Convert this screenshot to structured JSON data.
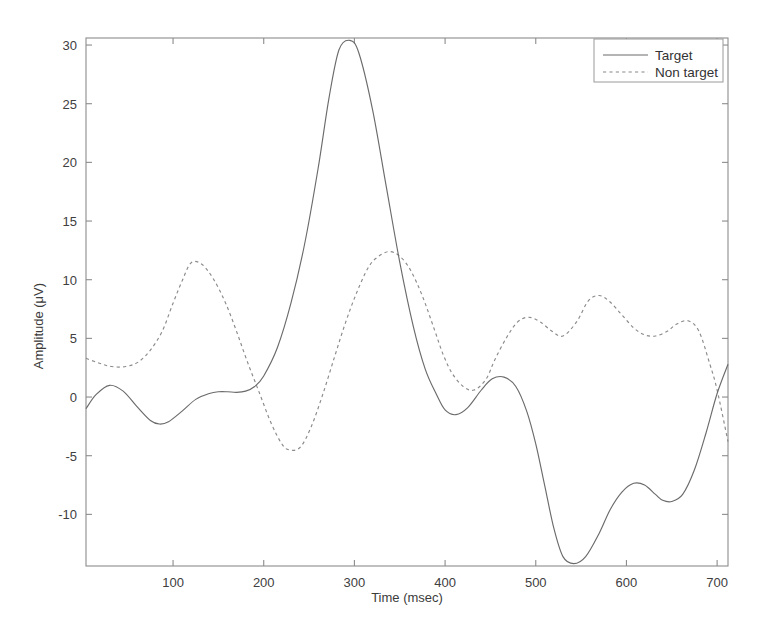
{
  "chart_data": {
    "type": "line",
    "title": "",
    "xlabel": "Time (msec)",
    "ylabel": "Amplitude (μV)",
    "xlim": [
      4,
      712
    ],
    "ylim": [
      -14.4,
      30.6
    ],
    "xticks": [
      100,
      200,
      300,
      400,
      500,
      600,
      700
    ],
    "yticks": [
      -10,
      -5,
      0,
      5,
      10,
      15,
      20,
      25,
      30
    ],
    "xtick_labels": [
      "100",
      "200",
      "300",
      "400",
      "500",
      "600",
      "700"
    ],
    "ytick_labels": [
      "-10",
      "-5",
      "0",
      "5",
      "10",
      "15",
      "20",
      "25",
      "30"
    ],
    "grid": false,
    "legend_position": "top-right",
    "legend_entries": [
      "Target",
      "Non target"
    ],
    "series": [
      {
        "name": "Target",
        "style": "solid",
        "color": "#6b6b6b",
        "x": [
          4,
          15,
          30,
          45,
          60,
          75,
          85,
          95,
          110,
          125,
          140,
          150,
          160,
          170,
          180,
          190,
          200,
          215,
          230,
          245,
          260,
          272,
          283,
          295,
          305,
          320,
          335,
          350,
          365,
          378,
          390,
          400,
          412,
          425,
          440,
          452,
          465,
          478,
          490,
          500,
          510,
          520,
          530,
          542,
          555,
          570,
          582,
          595,
          608,
          620,
          632,
          640,
          650,
          662,
          675,
          688,
          700,
          712
        ],
        "y": [
          -1.0,
          0.2,
          1.0,
          0.5,
          -0.8,
          -2.0,
          -2.3,
          -2.1,
          -1.2,
          -0.2,
          0.3,
          0.45,
          0.45,
          0.4,
          0.5,
          0.9,
          1.8,
          4.2,
          8.0,
          13.0,
          19.5,
          25.5,
          29.6,
          30.4,
          29.3,
          24.5,
          18.0,
          11.5,
          6.0,
          2.4,
          0.3,
          -1.1,
          -1.5,
          -0.9,
          0.6,
          1.55,
          1.7,
          0.9,
          -1.2,
          -4.0,
          -7.6,
          -11.2,
          -13.6,
          -14.2,
          -13.6,
          -11.6,
          -9.6,
          -8.1,
          -7.35,
          -7.5,
          -8.3,
          -8.8,
          -8.9,
          -8.3,
          -6.2,
          -3.0,
          0.3,
          2.8
        ]
      },
      {
        "name": "Non target",
        "style": "dotted",
        "color": "#8a8a8a",
        "x": [
          4,
          18,
          32,
          48,
          62,
          75,
          88,
          100,
          110,
          120,
          132,
          145,
          158,
          170,
          182,
          195,
          208,
          220,
          228,
          240,
          252,
          265,
          278,
          290,
          302,
          315,
          325,
          338,
          350,
          362,
          375,
          388,
          398,
          408,
          420,
          432,
          445,
          455,
          468,
          480,
          492,
          505,
          518,
          530,
          545,
          558,
          570,
          582,
          595,
          608,
          620,
          632,
          645,
          655,
          668,
          680,
          692,
          700,
          712
        ],
        "y": [
          3.3,
          2.9,
          2.6,
          2.6,
          3.0,
          4.0,
          5.6,
          8.0,
          9.9,
          11.45,
          11.3,
          10.0,
          8.0,
          5.6,
          3.0,
          0.4,
          -2.2,
          -4.0,
          -4.5,
          -4.3,
          -2.6,
          0.2,
          3.4,
          6.3,
          8.8,
          11.0,
          11.9,
          12.4,
          12.0,
          10.8,
          8.6,
          5.8,
          3.6,
          2.0,
          0.9,
          0.6,
          1.5,
          3.2,
          5.1,
          6.4,
          6.8,
          6.4,
          5.6,
          5.2,
          6.4,
          8.2,
          8.65,
          8.1,
          7.0,
          5.9,
          5.3,
          5.2,
          5.6,
          6.2,
          6.5,
          5.6,
          2.8,
          0.6,
          -3.8
        ]
      }
    ]
  },
  "axes": {
    "y_axis_title": "Amplitude (μV)",
    "x_axis_title": "Time (msec)"
  },
  "legend": {
    "items": [
      {
        "label": "Target",
        "style": "solid"
      },
      {
        "label": "Non target",
        "style": "dotted"
      }
    ]
  }
}
